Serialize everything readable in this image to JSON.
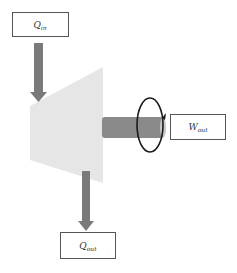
{
  "diagram": {
    "type": "turbine-energy-flow",
    "labels": {
      "heat_in": {
        "main": "Q",
        "sub": "in"
      },
      "work_out": {
        "main": "W",
        "sub": "out"
      },
      "heat_out": {
        "main": "Q",
        "sub": "out"
      }
    },
    "colors": {
      "turbine_body": "#e6e6e6",
      "arrow": "#7a7a7a",
      "shaft": "#8a8a8a",
      "shaft_end": "#c8c8c8",
      "ellipse": "#1a1a1a",
      "box_border": "#555555",
      "background": "#ffffff"
    }
  }
}
